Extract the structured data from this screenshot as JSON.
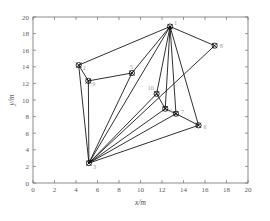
{
  "chart_data": {
    "type": "scatter",
    "title": "",
    "subtitle": "",
    "xlabel": "x/m",
    "ylabel": "y/m",
    "xlim": [
      0,
      20
    ],
    "ylim": [
      0,
      20
    ],
    "xticks": [
      0,
      2,
      4,
      6,
      8,
      10,
      12,
      14,
      16,
      18,
      20
    ],
    "yticks": [
      0,
      2,
      4,
      6,
      8,
      10,
      12,
      14,
      16,
      18,
      20
    ],
    "xticklabels": [
      "0",
      "2",
      "4",
      "6",
      "8",
      "10",
      "12",
      "14",
      "16",
      "18",
      "20"
    ],
    "yticklabels": [
      "0",
      "2",
      "4",
      "6",
      "8",
      "10",
      "12",
      "14",
      "16",
      "18",
      "20"
    ],
    "grid": false,
    "legend": null,
    "marker_style": "circle-with-cross",
    "line_color": "#1a1a1a",
    "marker_color": "#000000",
    "nodes": [
      {
        "id": "1",
        "label": "1",
        "x": 12.75,
        "y": 18.85,
        "label_dx": 4,
        "label_dy": -2
      },
      {
        "id": "2",
        "label": "2",
        "x": 4.25,
        "y": 14.2,
        "label_dx": 4,
        "label_dy": 5
      },
      {
        "id": "3",
        "label": "3",
        "x": 5.2,
        "y": 2.4,
        "label_dx": 4,
        "label_dy": 6
      },
      {
        "id": "4",
        "label": "4",
        "x": 12.3,
        "y": 8.95,
        "label_dx": 4,
        "label_dy": 4
      },
      {
        "id": "5",
        "label": "5",
        "x": 9.2,
        "y": 13.25,
        "label_dx": -2,
        "label_dy": -4
      },
      {
        "id": "6",
        "label": "6",
        "x": 15.4,
        "y": 6.95,
        "label_dx": 5,
        "label_dy": 4
      },
      {
        "id": "7",
        "label": "7",
        "x": 13.3,
        "y": 8.35,
        "label_dx": 5,
        "label_dy": 0
      },
      {
        "id": "8",
        "label": "8",
        "x": 16.9,
        "y": 16.55,
        "label_dx": 5,
        "label_dy": 2
      },
      {
        "id": "9",
        "label": "9",
        "x": 5.15,
        "y": 12.3,
        "label_dx": 4,
        "label_dy": 5
      },
      {
        "id": "10",
        "label": "10",
        "x": 11.5,
        "y": 10.75,
        "label_dx": -9,
        "label_dy": -4
      }
    ],
    "edges": [
      {
        "from": "2",
        "to": "1"
      },
      {
        "from": "2",
        "to": "9"
      },
      {
        "from": "2",
        "to": "3"
      },
      {
        "from": "9",
        "to": "5"
      },
      {
        "from": "9",
        "to": "3"
      },
      {
        "from": "5",
        "to": "1"
      },
      {
        "from": "5",
        "to": "3"
      },
      {
        "from": "1",
        "to": "8"
      },
      {
        "from": "1",
        "to": "3"
      },
      {
        "from": "1",
        "to": "10"
      },
      {
        "from": "1",
        "to": "4"
      },
      {
        "from": "1",
        "to": "7"
      },
      {
        "from": "1",
        "to": "6"
      },
      {
        "from": "8",
        "to": "3"
      },
      {
        "from": "10",
        "to": "3"
      },
      {
        "from": "10",
        "to": "4"
      },
      {
        "from": "4",
        "to": "3"
      },
      {
        "from": "4",
        "to": "7"
      },
      {
        "from": "7",
        "to": "3"
      },
      {
        "from": "7",
        "to": "6"
      },
      {
        "from": "6",
        "to": "3"
      }
    ]
  }
}
